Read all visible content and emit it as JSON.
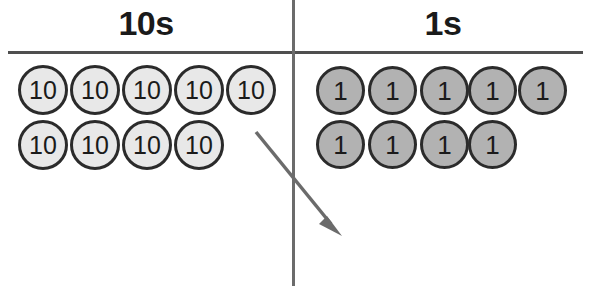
{
  "figure": {
    "type": "place-value-chart",
    "title_tens": "10s",
    "title_ones": "1s",
    "colors": {
      "tens_disc_fill": "#e8e8e8",
      "ones_disc_fill": "#b2b2b2",
      "disc_outline": "#2b2b2b",
      "rule": "#4f4f4f",
      "divider": "#6b6b6b",
      "arrow": "#6b6b6b",
      "background": "#ffffff"
    },
    "columns": [
      {
        "name": "tens",
        "heading": "10s",
        "disc_label": "10",
        "rows": [
          {
            "labels": [
              "10",
              "10",
              "10",
              "10",
              "10"
            ]
          },
          {
            "labels": [
              "10",
              "10",
              "10",
              "10"
            ]
          }
        ],
        "disc_count": 9,
        "column_value": 90
      },
      {
        "name": "ones",
        "heading": "1s",
        "disc_label": "1",
        "rows": [
          {
            "labels": [
              "1",
              "1",
              "1",
              "1",
              "1"
            ]
          },
          {
            "labels": [
              "1",
              "1",
              "1",
              "1"
            ]
          }
        ],
        "disc_count": 9,
        "column_value": 9
      }
    ],
    "annotation": {
      "name": "regrouping-arrow",
      "description": "arrow pointing from the tens column down-right into the ones column"
    }
  }
}
